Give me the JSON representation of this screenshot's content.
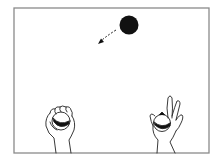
{
  "figure": {
    "frame": {
      "x": 14,
      "y": 8,
      "width": 195,
      "height": 145,
      "stroke": "#8a8a8a"
    },
    "colors": {
      "ink": "#111111",
      "background": "#ffffff",
      "frame": "#8a8a8a"
    },
    "elements": [
      {
        "name": "airborne-ball",
        "type": "filled-circle",
        "cx": 129,
        "cy": 25,
        "r": 9
      },
      {
        "name": "motion-arrow",
        "type": "dashed-arrow",
        "from": [
          116,
          30
        ],
        "to": [
          99,
          43
        ]
      },
      {
        "name": "left-hand",
        "holding": "striped-ball",
        "ball_center": [
          60,
          122
        ]
      },
      {
        "name": "right-hand",
        "holding": "striped-ball",
        "ball_center": [
          162,
          123
        ]
      }
    ]
  }
}
